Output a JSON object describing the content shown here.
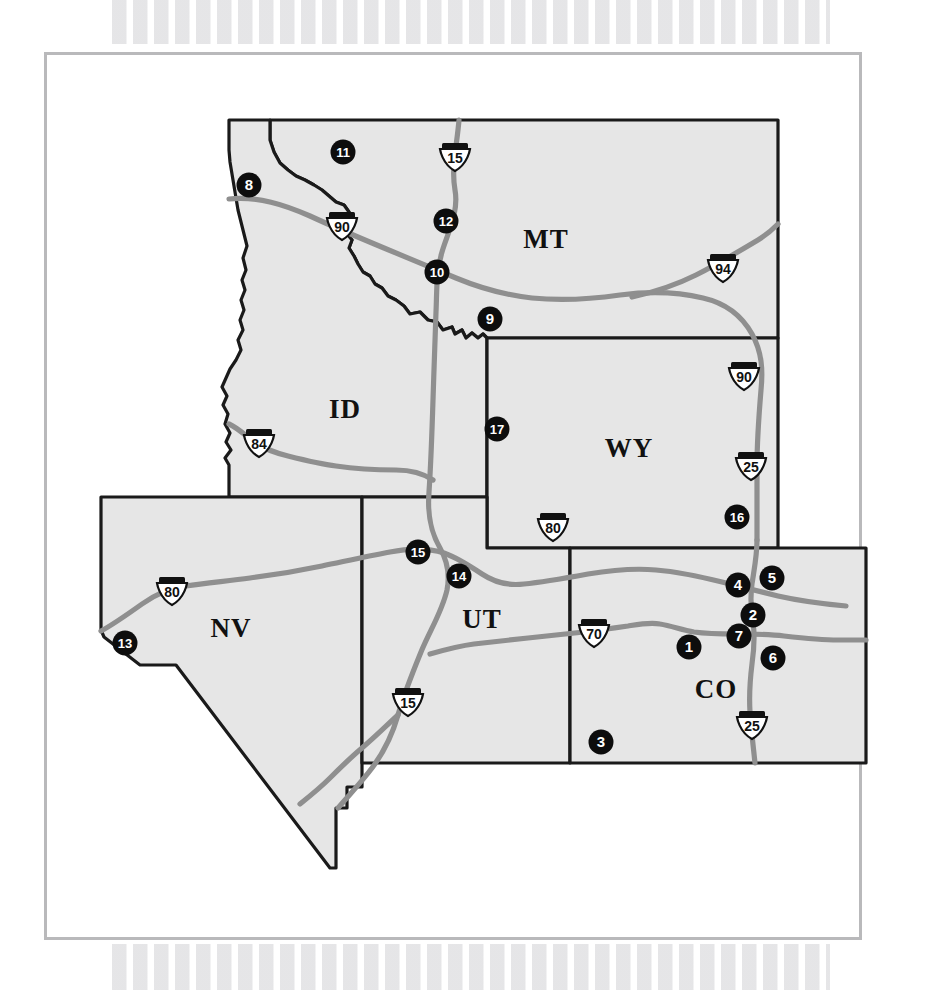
{
  "figure": {
    "kind": "reference-map",
    "region": "Western United States — Intermountain West",
    "frame_color": "#b9b9bb",
    "state_fill": "#e6e6e6",
    "state_outline": "#1a1a1a",
    "road_color": "#8f8f8f",
    "marker_fill": "#0d0d0d",
    "marker_text_color": "#ffffff"
  },
  "states": [
    {
      "code": "MT",
      "label": "MT",
      "label_x": 546,
      "label_y": 248
    },
    {
      "code": "ID",
      "label": "ID",
      "label_x": 345,
      "label_y": 418
    },
    {
      "code": "WY",
      "label": "WY",
      "label_x": 629,
      "label_y": 457
    },
    {
      "code": "NV",
      "label": "NV",
      "label_x": 231,
      "label_y": 637
    },
    {
      "code": "UT",
      "label": "UT",
      "label_x": 482,
      "label_y": 628
    },
    {
      "code": "CO",
      "label": "CO",
      "label_x": 716,
      "label_y": 698
    }
  ],
  "interstate_shields": [
    {
      "number": "15",
      "x": 455,
      "y": 158,
      "state": "MT"
    },
    {
      "number": "90",
      "x": 342,
      "y": 227,
      "state": "ID"
    },
    {
      "number": "94",
      "x": 723,
      "y": 269,
      "state": "MT"
    },
    {
      "number": "90",
      "x": 744,
      "y": 377,
      "state": "WY"
    },
    {
      "number": "25",
      "x": 751,
      "y": 467,
      "state": "WY"
    },
    {
      "number": "84",
      "x": 259,
      "y": 444,
      "state": "ID"
    },
    {
      "number": "80",
      "x": 553,
      "y": 528,
      "state": "WY"
    },
    {
      "number": "80",
      "x": 172,
      "y": 592,
      "state": "NV"
    },
    {
      "number": "70",
      "x": 594,
      "y": 634,
      "state": "CO"
    },
    {
      "number": "15",
      "x": 408,
      "y": 703,
      "state": "UT"
    },
    {
      "number": "25",
      "x": 752,
      "y": 726,
      "state": "CO"
    }
  ],
  "site_markers": [
    {
      "id": "1",
      "x": 689,
      "y": 647,
      "state": "CO"
    },
    {
      "id": "2",
      "x": 753,
      "y": 615,
      "state": "CO"
    },
    {
      "id": "3",
      "x": 601,
      "y": 742,
      "state": "CO"
    },
    {
      "id": "4",
      "x": 738,
      "y": 585,
      "state": "CO"
    },
    {
      "id": "5",
      "x": 772,
      "y": 578,
      "state": "CO"
    },
    {
      "id": "6",
      "x": 773,
      "y": 658,
      "state": "CO"
    },
    {
      "id": "7",
      "x": 739,
      "y": 636,
      "state": "CO"
    },
    {
      "id": "8",
      "x": 249,
      "y": 185,
      "state": "ID"
    },
    {
      "id": "9",
      "x": 490,
      "y": 319,
      "state": "MT"
    },
    {
      "id": "10",
      "x": 437,
      "y": 272,
      "state": "MT"
    },
    {
      "id": "11",
      "x": 343,
      "y": 152,
      "state": "MT"
    },
    {
      "id": "12",
      "x": 446,
      "y": 221,
      "state": "MT"
    },
    {
      "id": "13",
      "x": 125,
      "y": 643,
      "state": "NV"
    },
    {
      "id": "14",
      "x": 459,
      "y": 576,
      "state": "UT"
    },
    {
      "id": "15",
      "x": 418,
      "y": 552,
      "state": "UT"
    },
    {
      "id": "16",
      "x": 737,
      "y": 517,
      "state": "WY"
    },
    {
      "id": "17",
      "x": 497,
      "y": 429,
      "state": "WY"
    }
  ],
  "chart_data": {
    "type": "map",
    "title": "",
    "projection": "plate-carree-approx",
    "states_shown": [
      "MT",
      "ID",
      "WY",
      "NV",
      "UT",
      "CO"
    ],
    "marker_count": 17,
    "marker_ids": [
      "1",
      "2",
      "3",
      "4",
      "5",
      "6",
      "7",
      "8",
      "9",
      "10",
      "11",
      "12",
      "13",
      "14",
      "15",
      "16",
      "17"
    ],
    "interstates_shown": [
      "15",
      "90",
      "94",
      "25",
      "84",
      "80",
      "70"
    ],
    "markers_per_state": {
      "CO": [
        "1",
        "2",
        "3",
        "4",
        "5",
        "6",
        "7"
      ],
      "ID": [
        "8"
      ],
      "MT": [
        "9",
        "10",
        "11",
        "12"
      ],
      "NV": [
        "13"
      ],
      "UT": [
        "14",
        "15"
      ],
      "WY": [
        "16",
        "17"
      ]
    },
    "legend": "",
    "grid": false
  }
}
